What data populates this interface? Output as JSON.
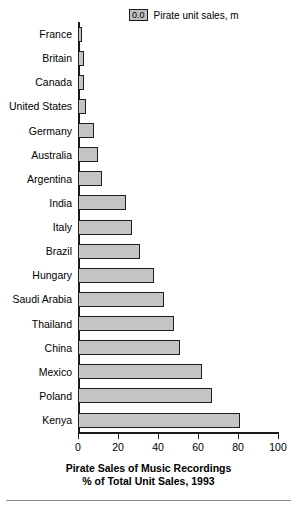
{
  "legend": {
    "swatch_label": "0.0",
    "text": "Pirate unit sales, m"
  },
  "axis": {
    "tick_labels": [
      "0",
      "20",
      "40",
      "60",
      "80",
      "100"
    ]
  },
  "titles": {
    "line1": "Pirate Sales of Music Recordings",
    "line2": "% of Total Unit Sales, 1993"
  },
  "colors": {
    "bar_fill": "#c4c4c4",
    "bar_border": "#1f1f1f",
    "axis": "#1a1a1a",
    "text": "#000000",
    "background": "#ffffff"
  },
  "chart_data": {
    "type": "bar",
    "orientation": "horizontal",
    "title": "Pirate Sales of Music Recordings",
    "subtitle": "% of Total Unit Sales, 1993",
    "xlabel": "% of Total Unit Sales, 1993",
    "ylabel": "",
    "xlim": [
      0,
      100
    ],
    "xticks": [
      0,
      20,
      40,
      60,
      80,
      100
    ],
    "grid": false,
    "legend": "Pirate unit sales, m",
    "legend_position": "top-right",
    "categories": [
      "France",
      "Britain",
      "Canada",
      "United States",
      "Germany",
      "Australia",
      "Argentina",
      "India",
      "Italy",
      "Brazil",
      "Hungary",
      "Saudi Arabia",
      "Thailand",
      "China",
      "Mexico",
      "Poland",
      "Kenya"
    ],
    "values": [
      2,
      3,
      3,
      4,
      8,
      10,
      12,
      24,
      27,
      31,
      38,
      43,
      48,
      51,
      62,
      67,
      81
    ],
    "series": [
      {
        "name": "Pirate sales % of total unit sales",
        "values": [
          2,
          3,
          3,
          4,
          8,
          10,
          12,
          24,
          27,
          31,
          38,
          43,
          48,
          51,
          62,
          67,
          81
        ]
      }
    ]
  }
}
